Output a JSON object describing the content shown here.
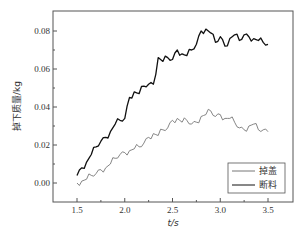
{
  "chart_data": {
    "type": "line",
    "title": "",
    "xlabel": "t/s",
    "ylabel": "掉下质量/kg",
    "xlim": [
      1.25,
      3.75
    ],
    "ylim": [
      -0.0105,
      0.0915
    ],
    "xticks": [
      1.5,
      2.0,
      2.5,
      3.0,
      3.5
    ],
    "xtick_labels": [
      "1.5",
      "2.0",
      "2.5",
      "3.0",
      "3.5"
    ],
    "yticks": [
      0.0,
      0.02,
      0.04,
      0.06,
      0.08
    ],
    "ytick_labels": [
      "0.00",
      "0.02",
      "0.04",
      "0.06",
      "0.08"
    ],
    "grid": false,
    "legend_position": "lower right",
    "series": [
      {
        "name": "掉盖",
        "color": "#777777",
        "x": [
          1.5,
          1.55,
          1.6,
          1.65,
          1.7,
          1.75,
          1.8,
          1.85,
          1.9,
          1.95,
          2.0,
          2.05,
          2.1,
          2.15,
          2.2,
          2.25,
          2.3,
          2.35,
          2.4,
          2.45,
          2.5,
          2.55,
          2.6,
          2.65,
          2.7,
          2.75,
          2.8,
          2.85,
          2.9,
          2.95,
          3.0,
          3.05,
          3.1,
          3.15,
          3.2,
          3.25,
          3.3,
          3.35,
          3.4,
          3.45,
          3.5
        ],
        "values": [
          0.0,
          0.001,
          0.002,
          0.004,
          0.005,
          0.007,
          0.008,
          0.01,
          0.013,
          0.015,
          0.016,
          0.017,
          0.018,
          0.019,
          0.021,
          0.024,
          0.026,
          0.025,
          0.028,
          0.029,
          0.033,
          0.034,
          0.032,
          0.033,
          0.031,
          0.032,
          0.035,
          0.036,
          0.038,
          0.035,
          0.036,
          0.034,
          0.034,
          0.032,
          0.029,
          0.028,
          0.03,
          0.031,
          0.028,
          0.028,
          0.027
        ]
      },
      {
        "name": "断料",
        "color": "#111111",
        "x": [
          1.5,
          1.55,
          1.6,
          1.65,
          1.7,
          1.75,
          1.8,
          1.85,
          1.9,
          1.95,
          2.0,
          2.05,
          2.1,
          2.15,
          2.2,
          2.25,
          2.3,
          2.35,
          2.4,
          2.45,
          2.5,
          2.55,
          2.6,
          2.65,
          2.7,
          2.75,
          2.8,
          2.85,
          2.9,
          2.95,
          3.0,
          3.05,
          3.1,
          3.15,
          3.2,
          3.25,
          3.3,
          3.35,
          3.4,
          3.45,
          3.5
        ],
        "values": [
          0.004,
          0.008,
          0.011,
          0.015,
          0.019,
          0.022,
          0.024,
          0.027,
          0.031,
          0.033,
          0.034,
          0.045,
          0.048,
          0.047,
          0.051,
          0.052,
          0.052,
          0.066,
          0.064,
          0.066,
          0.065,
          0.07,
          0.068,
          0.067,
          0.07,
          0.073,
          0.08,
          0.081,
          0.079,
          0.074,
          0.077,
          0.072,
          0.076,
          0.078,
          0.075,
          0.078,
          0.077,
          0.076,
          0.075,
          0.074,
          0.073
        ]
      }
    ]
  }
}
